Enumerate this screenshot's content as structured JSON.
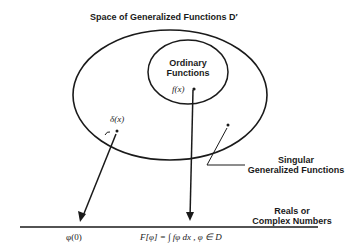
{
  "title": "Space of Generalized Functions D′",
  "inner_label_line1": "Ordinary",
  "inner_label_line2": "Functions",
  "f_point": "f(x)",
  "delta_point": "δ(x)",
  "singular_line1": "Singular",
  "singular_line2": "Generalized Functions",
  "reals_line1": "Reals or",
  "reals_line2": "Complex Numbers",
  "phi_zero": "φ(0)",
  "functional": "F[φ] = ∫ fφ dx , φ ∈ D",
  "colors": {
    "ink": "#1a1a1a",
    "background": "#ffffff"
  }
}
